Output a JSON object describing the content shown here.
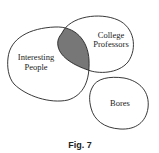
{
  "diagram": {
    "type": "euler-diagram",
    "sets": [
      {
        "id": "interesting",
        "label_lines": [
          "Interesting",
          "People"
        ]
      },
      {
        "id": "professors",
        "label_lines": [
          "College",
          "Professors"
        ]
      },
      {
        "id": "bores",
        "label_lines": [
          "Bores"
        ]
      }
    ],
    "shaded_region": "interesting ∩ professors",
    "shade_color": "#777777",
    "caption": "Fig. 7"
  }
}
